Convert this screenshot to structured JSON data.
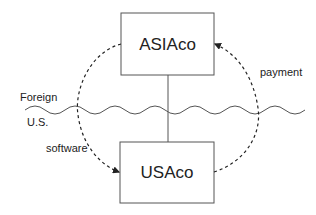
{
  "diagram": {
    "entities": [
      {
        "id": "asiaco",
        "label": "ASIAco"
      },
      {
        "id": "usaco",
        "label": "USAco"
      }
    ],
    "border": {
      "foreign_label": "Foreign",
      "us_label": "U.S."
    },
    "flows": [
      {
        "label": "software",
        "from": "asiaco",
        "to": "usaco"
      },
      {
        "label": "payment",
        "from": "usaco",
        "to": "asiaco"
      }
    ]
  },
  "colors": {
    "stroke": "#555555",
    "text": "#222222"
  }
}
